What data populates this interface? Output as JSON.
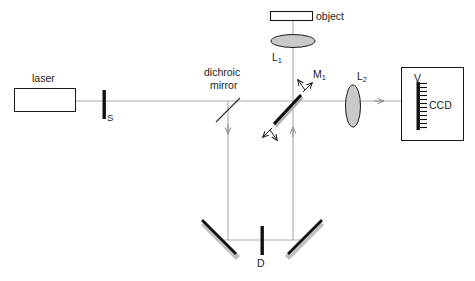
{
  "figure": {
    "background_color": "#ffffff",
    "beam_color": "#aaaaaa",
    "line_color": "#1a1a1a",
    "optic_fill_color": "#c9c9c9",
    "mirror_shadow_color": "#c0c0c0"
  },
  "labels": {
    "laser": "laser",
    "shutter": "S",
    "dichroic_line1": "dichroic",
    "dichroic_line2": "mirror",
    "object": "object",
    "lens1_base": "L",
    "lens1_sub": "1",
    "lens2_base": "L",
    "lens2_sub": "2",
    "beamsplitter_base": "M",
    "beamsplitter_sub": "1",
    "detector": "D",
    "ccd_top": "V",
    "ccd": "CCD"
  },
  "components": [
    {
      "name": "laser-source",
      "label": "laser",
      "type": "box",
      "x": 14,
      "y": 88,
      "width": 61,
      "height": 23
    },
    {
      "name": "shutter",
      "label": "S",
      "type": "bar-vertical",
      "x": 104,
      "y": 90,
      "height": 29
    },
    {
      "name": "dichroic-mirror",
      "label": "dichroic mirror",
      "type": "thin-diagonal",
      "x": 228,
      "y": 110
    },
    {
      "name": "beamsplitter-m1",
      "label": "M1",
      "type": "thick-diagonal",
      "x": 288,
      "y": 110
    },
    {
      "name": "object",
      "label": "object",
      "type": "box",
      "x": 270,
      "y": 11,
      "width": 42,
      "height": 10
    },
    {
      "name": "lens-l1",
      "label": "L1",
      "type": "ellipse-horizontal",
      "x": 293,
      "y": 41,
      "rx": 22,
      "ry": 6.5
    },
    {
      "name": "lens-l2",
      "label": "L2",
      "type": "ellipse-vertical",
      "x": 353,
      "y": 106,
      "rx": 7.5,
      "ry": 21
    },
    {
      "name": "ccd-housing",
      "label": "CCD",
      "type": "box",
      "x": 401,
      "y": 67,
      "width": 62,
      "height": 73
    },
    {
      "name": "ccd-sensor",
      "label": "CCD sensor",
      "type": "comb",
      "x": 418,
      "y": 82,
      "height": 48
    },
    {
      "name": "detector-d",
      "label": "D",
      "type": "bar-vertical",
      "x": 262,
      "y": 228,
      "height": 29
    },
    {
      "name": "mirror-bottom-left",
      "label": "mirror",
      "type": "thick-diagonal",
      "x": 222,
      "y": 240
    },
    {
      "name": "mirror-bottom-right",
      "label": "mirror",
      "type": "thick-diagonal",
      "x": 302,
      "y": 240
    }
  ],
  "beam_paths": [
    {
      "name": "beam-laser-to-ccd",
      "from": "laser",
      "to": "ccd",
      "orientation": "horizontal",
      "y": 101
    },
    {
      "name": "beam-dichroic-down",
      "orientation": "vertical",
      "x": 228,
      "direction": "down"
    },
    {
      "name": "beam-object-down",
      "orientation": "vertical",
      "x": 293,
      "direction": "down"
    },
    {
      "name": "beam-m1-up",
      "orientation": "vertical",
      "x": 293,
      "direction": "up"
    },
    {
      "name": "beam-bottom-horizontal",
      "orientation": "horizontal",
      "y": 240
    }
  ]
}
